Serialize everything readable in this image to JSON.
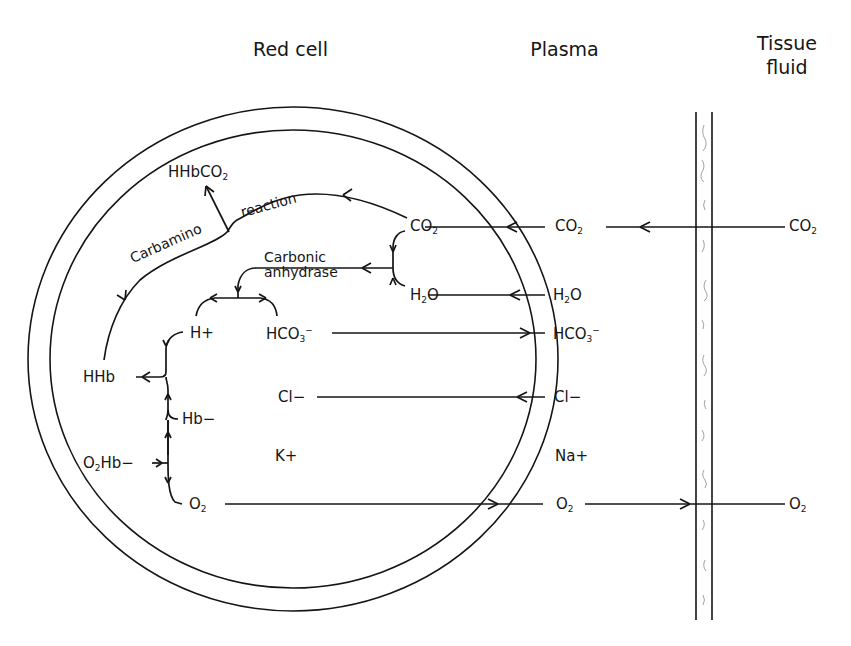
{
  "headers": {
    "red_cell": "Red cell",
    "plasma": "Plasma",
    "tissue_fluid_line1": "Tissue",
    "tissue_fluid_line2": "fluid"
  },
  "red_cell": {
    "hhbco2": {
      "base": "HHbCO",
      "sub": "2"
    },
    "carbamino": "Carbamino",
    "reaction": "reaction",
    "carbonic": "Carbonic",
    "anhydrase": "anhydrase",
    "co2": {
      "base": "CO",
      "sub": "2"
    },
    "h2o": {
      "a": "H",
      "sub": "2",
      "b": "O"
    },
    "h_plus": "H+",
    "hco3": {
      "base": "HCO",
      "sub": "3",
      "sup": "−"
    },
    "hhb": "HHb",
    "cl": "Cl−",
    "hb_minus": "Hb−",
    "o2hb": {
      "a": "O",
      "sub": "2",
      "b": "Hb−"
    },
    "k_plus": "K+",
    "o2": {
      "base": "O",
      "sub": "2"
    }
  },
  "plasma": {
    "co2": {
      "base": "CO",
      "sub": "2"
    },
    "h2o": {
      "a": "H",
      "sub": "2",
      "b": "O"
    },
    "hco3": {
      "base": "HCO",
      "sub": "3",
      "sup": "−"
    },
    "cl": "Cl−",
    "na_plus": "Na+",
    "o2": {
      "base": "O",
      "sub": "2"
    }
  },
  "tissue_fluid": {
    "co2": {
      "base": "CO",
      "sub": "2"
    },
    "o2": {
      "base": "O",
      "sub": "2"
    }
  },
  "flows": [
    {
      "species": "CO2",
      "from": "Tissue fluid",
      "to": "Red cell",
      "direction": "leftward"
    },
    {
      "species": "H2O",
      "from": "Plasma",
      "to": "Red cell",
      "direction": "leftward"
    },
    {
      "species": "HCO3-",
      "from": "Red cell",
      "to": "Plasma",
      "direction": "rightward"
    },
    {
      "species": "Cl-",
      "from": "Plasma",
      "to": "Red cell",
      "direction": "leftward"
    },
    {
      "species": "O2",
      "from": "Red cell",
      "to": "Tissue fluid",
      "direction": "rightward"
    }
  ],
  "colors": {
    "ink": "#151515",
    "background": "#ffffff",
    "stipple": "#8a8a8a"
  }
}
